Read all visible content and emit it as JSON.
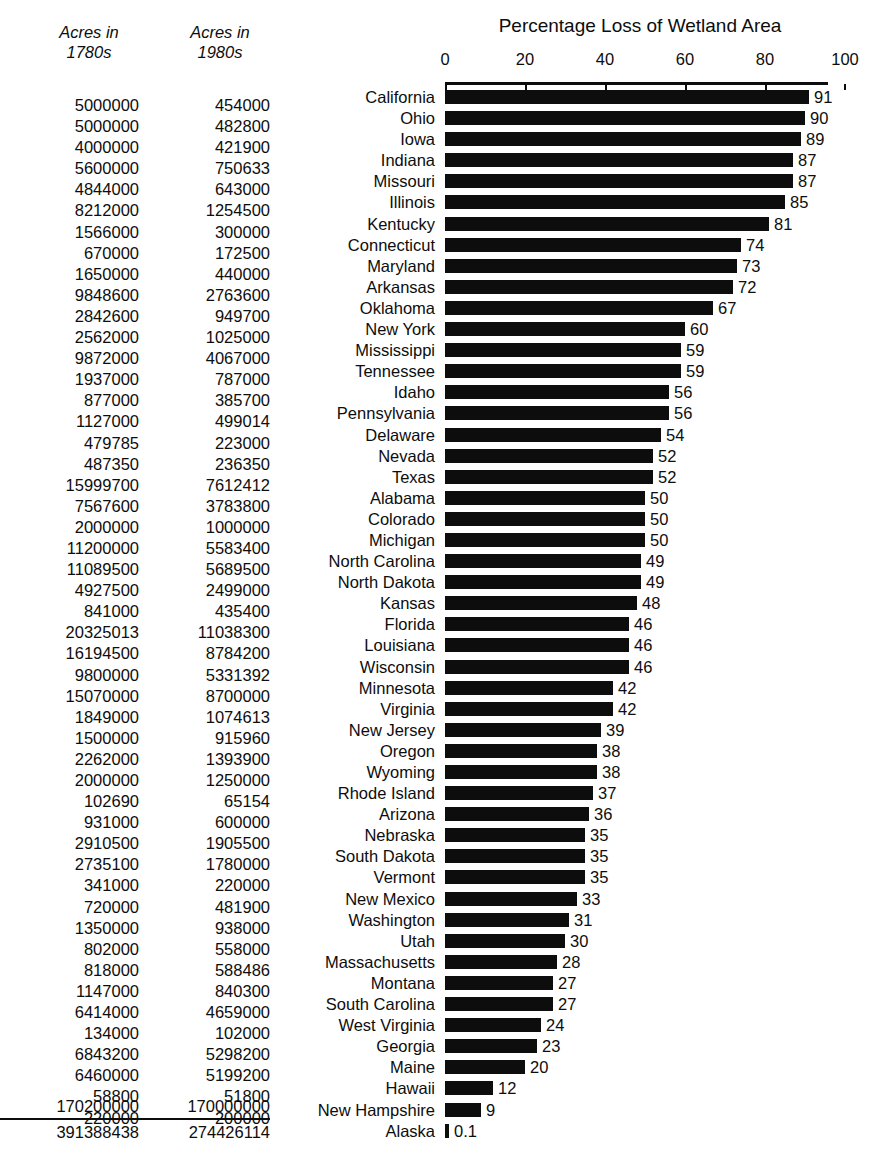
{
  "columns": {
    "acres_1780s": {
      "line1": "Acres in",
      "line2": "1780s"
    },
    "acres_1980s": {
      "line1": "Acres in",
      "line2": "1980s"
    },
    "total_1780s": "391388438",
    "total_1980s": "274426114"
  },
  "chart_data": {
    "type": "bar",
    "title": "Percentage Loss of Wetland Area",
    "xlabel": "",
    "ylabel": "",
    "xlim": [
      0,
      100
    ],
    "grid": false,
    "orientation": "horizontal",
    "tick_labels": [
      "0",
      "20",
      "40",
      "60",
      "80",
      "100"
    ],
    "ticks": [
      0,
      20,
      40,
      60,
      80,
      100
    ],
    "categories": [
      "California",
      "Ohio",
      "Iowa",
      "Indiana",
      "Missouri",
      "Illinois",
      "Kentucky",
      "Connecticut",
      "Maryland",
      "Arkansas",
      "Oklahoma",
      "New York",
      "Mississippi",
      "Tennessee",
      "Idaho",
      "Pennsylvania",
      "Delaware",
      "Nevada",
      "Texas",
      "Alabama",
      "Colorado",
      "Michigan",
      "North Carolina",
      "North Dakota",
      "Kansas",
      "Florida",
      "Louisiana",
      "Wisconsin",
      "Minnesota",
      "Virginia",
      "New Jersey",
      "Oregon",
      "Wyoming",
      "Rhode Island",
      "Arizona",
      "Nebraska",
      "South Dakota",
      "Vermont",
      "New Mexico",
      "Washington",
      "Utah",
      "Massachusetts",
      "Montana",
      "South Carolina",
      "West Virginia",
      "Georgia",
      "Maine",
      "Hawaii",
      "New Hampshire",
      "Alaska"
    ],
    "values": [
      91,
      90,
      89,
      87,
      87,
      85,
      81,
      74,
      73,
      72,
      67,
      60,
      59,
      59,
      56,
      56,
      54,
      52,
      52,
      50,
      50,
      50,
      49,
      49,
      48,
      46,
      46,
      46,
      42,
      42,
      39,
      38,
      38,
      37,
      36,
      35,
      35,
      35,
      33,
      31,
      30,
      28,
      27,
      27,
      24,
      23,
      20,
      12,
      9,
      0.1
    ],
    "value_labels": [
      "91",
      "90",
      "89",
      "87",
      "87",
      "85",
      "81",
      "74",
      "73",
      "72",
      "67",
      "60",
      "59",
      "59",
      "56",
      "56",
      "54",
      "52",
      "52",
      "50",
      "50",
      "50",
      "49",
      "49",
      "48",
      "46",
      "46",
      "46",
      "42",
      "42",
      "39",
      "38",
      "38",
      "37",
      "36",
      "35",
      "35",
      "35",
      "33",
      "31",
      "30",
      "28",
      "27",
      "27",
      "24",
      "23",
      "20",
      "12",
      "9",
      "0.1"
    ],
    "acres_1780s": [
      "5000000",
      "5000000",
      "4000000",
      "5600000",
      "4844000",
      "8212000",
      "1566000",
      "670000",
      "1650000",
      "9848600",
      "2842600",
      "2562000",
      "9872000",
      "1937000",
      "877000",
      "1127000",
      "479785",
      "487350",
      "15999700",
      "7567600",
      "2000000",
      "11200000",
      "11089500",
      "4927500",
      "841000",
      "20325013",
      "16194500",
      "9800000",
      "15070000",
      "1849000",
      "1500000",
      "2262000",
      "2000000",
      "102690",
      "931000",
      "2910500",
      "2735100",
      "341000",
      "720000",
      "1350000",
      "802000",
      "818000",
      "1147000",
      "6414000",
      "134000",
      "6843200",
      "6460000",
      "58800",
      "220000",
      "170200000"
    ],
    "acres_1980s": [
      "454000",
      "482800",
      "421900",
      "750633",
      "643000",
      "1254500",
      "300000",
      "172500",
      "440000",
      "2763600",
      "949700",
      "1025000",
      "4067000",
      "787000",
      "385700",
      "499014",
      "223000",
      "236350",
      "7612412",
      "3783800",
      "1000000",
      "5583400",
      "5689500",
      "2499000",
      "435400",
      "11038300",
      "8784200",
      "5331392",
      "8700000",
      "1074613",
      "915960",
      "1393900",
      "1250000",
      "65154",
      "600000",
      "1905500",
      "1780000",
      "220000",
      "481900",
      "938000",
      "558000",
      "588486",
      "840300",
      "4659000",
      "102000",
      "5298200",
      "5199200",
      "51800",
      "200000",
      "170000000"
    ]
  },
  "colors": {
    "bar": "#0d0d0d",
    "text": "#0d0d0d",
    "background": "#ffffff"
  }
}
